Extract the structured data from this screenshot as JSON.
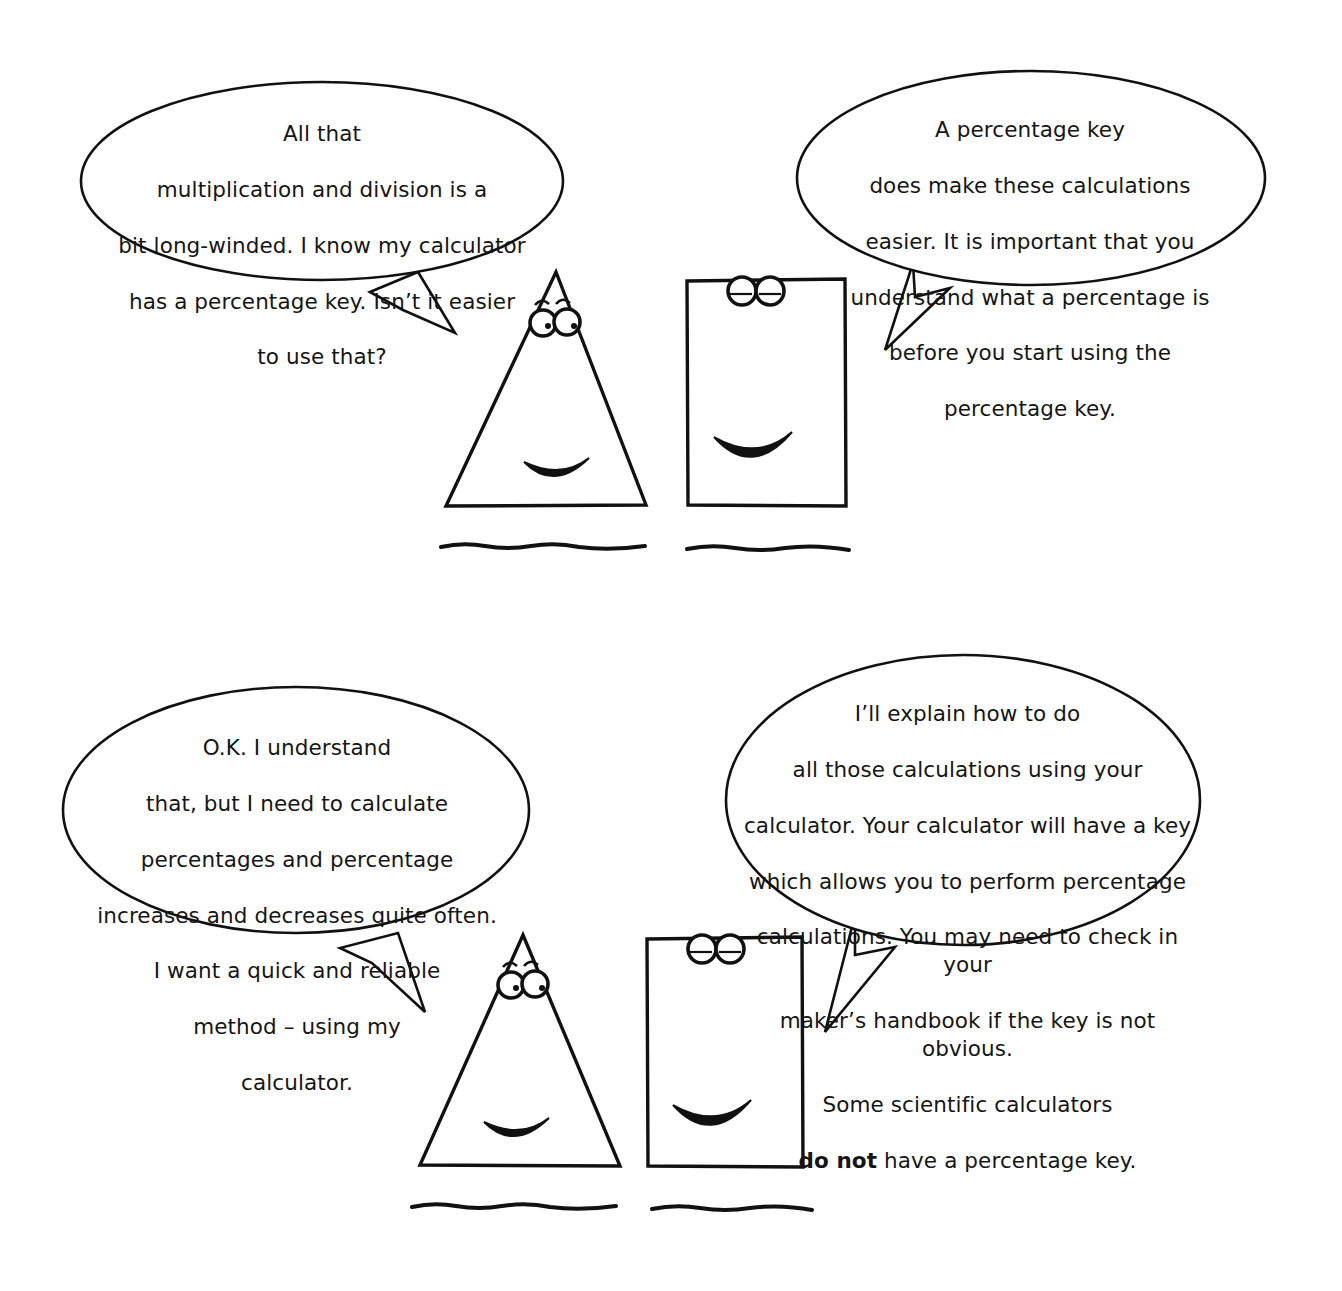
{
  "page": {
    "background_color": "#ffffff",
    "ink_color": "#111111"
  },
  "panels": [
    {
      "id": "panel-top",
      "characters": [
        "triangle-character",
        "rectangle-character"
      ]
    },
    {
      "id": "panel-bottom",
      "characters": [
        "triangle-character",
        "rectangle-character"
      ]
    }
  ],
  "bubbles": {
    "bubble1": {
      "speaker": "triangle-character",
      "panel": "panel-top",
      "lines": [
        "All that",
        "multiplication and division is a",
        "bit long-winded. I know my calculator",
        "has a percentage key. Isn’t it easier",
        "to use that?"
      ]
    },
    "bubble2": {
      "speaker": "rectangle-character",
      "panel": "panel-top",
      "lines": [
        "A percentage key",
        "does make these calculations",
        "easier. It is important that you",
        "understand what a percentage is",
        "before you start using the",
        "percentage key."
      ]
    },
    "bubble3": {
      "speaker": "triangle-character",
      "panel": "panel-bottom",
      "lines": [
        "O.K. I understand",
        "that, but I need to calculate",
        "percentages and percentage",
        "increases and decreases quite often.",
        "I want a quick and reliable",
        "method – using  my",
        "calculator."
      ]
    },
    "bubble4": {
      "speaker": "rectangle-character",
      "panel": "panel-bottom",
      "lines": [
        "I’ll explain how to do",
        "all those calculations using your",
        "calculator. Your calculator will have a key",
        "which allows you to perform percentage",
        "calculations. You may need to check in your",
        "maker’s handbook if the key is not obvious.",
        "Some scientific calculators"
      ],
      "last_line": {
        "emphasis": "do not",
        "rest": " have a percentage key."
      }
    }
  },
  "icons": {
    "triangle": "triangle-character-icon",
    "rectangle": "rectangle-character-icon",
    "eye": "eye-icon",
    "smile": "smile-icon",
    "ground": "ground-line-icon",
    "tail": "speech-tail-icon"
  }
}
